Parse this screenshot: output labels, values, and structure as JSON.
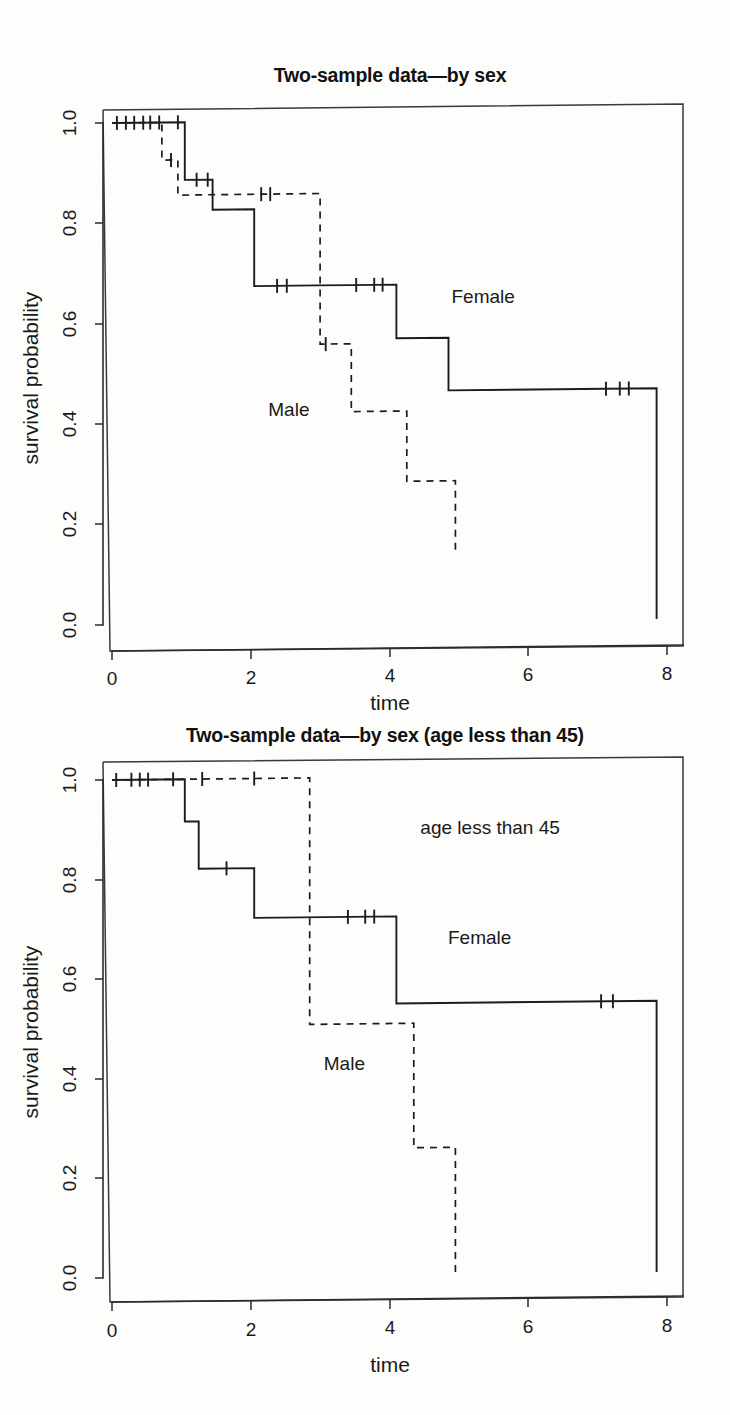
{
  "page": {
    "background": "#fdfdfc",
    "ink": "#1c1c1c"
  },
  "figures": [
    {
      "id": "figure-1",
      "title": "Two-sample data—by sex",
      "xlabel": "time",
      "ylabel": "survival probability",
      "xticks": [
        "0",
        "2",
        "4",
        "6",
        "8"
      ],
      "yticks": [
        "0.0",
        "0.2",
        "0.4",
        "0.6",
        "0.8",
        "1.0"
      ],
      "annotations": [
        {
          "text": "Female",
          "x": 5.35,
          "y": 0.645
        },
        {
          "text": "Male",
          "x": 2.55,
          "y": 0.425
        }
      ]
    },
    {
      "id": "figure-2",
      "title": "Two-sample data—by sex (age less than 45)",
      "xlabel": "time",
      "ylabel": "survival probability",
      "xticks": [
        "0",
        "2",
        "4",
        "6",
        "8"
      ],
      "yticks": [
        "0.0",
        "0.2",
        "0.4",
        "0.6",
        "0.8",
        "1.0"
      ],
      "annotations": [
        {
          "text": "age less than 45",
          "x": 5.45,
          "y": 0.895
        },
        {
          "text": "Female",
          "x": 5.3,
          "y": 0.675
        },
        {
          "text": "Male",
          "x": 3.35,
          "y": 0.425
        }
      ]
    }
  ],
  "chart_data": [
    {
      "type": "line",
      "subtype": "kaplan-meier-step",
      "title": "Two-sample data—by sex",
      "xlabel": "time",
      "ylabel": "survival probability",
      "xlim": [
        0,
        8.25
      ],
      "ylim": [
        0.0,
        1.0
      ],
      "xticks": [
        0,
        2,
        4,
        6,
        8
      ],
      "yticks": [
        0.0,
        0.2,
        0.4,
        0.6,
        0.8,
        1.0
      ],
      "grid": false,
      "legend": "inline-annotations",
      "series": [
        {
          "name": "Female",
          "linestyle": "solid",
          "color": "#1c1c1c",
          "steps": [
            {
              "time": 0.0,
              "surv": 1.0
            },
            {
              "time": 1.05,
              "surv": 0.885
            },
            {
              "time": 1.45,
              "surv": 0.825
            },
            {
              "time": 2.05,
              "surv": 0.672
            },
            {
              "time": 2.95,
              "surv": 0.672
            },
            {
              "time": 3.45,
              "surv": 0.672
            },
            {
              "time": 4.1,
              "surv": 0.565
            },
            {
              "time": 4.85,
              "surv": 0.46
            },
            {
              "time": 7.85,
              "surv": 0.0
            }
          ],
          "censored_times": [
            0.07,
            0.2,
            0.32,
            0.45,
            0.55,
            0.68,
            0.95,
            1.22,
            1.38,
            2.38,
            2.52,
            3.52,
            3.78,
            3.9,
            7.12,
            7.32,
            7.45
          ]
        },
        {
          "name": "Male",
          "linestyle": "dashed",
          "color": "#1c1c1c",
          "steps": [
            {
              "time": 0.0,
              "surv": 1.0
            },
            {
              "time": 0.72,
              "surv": 0.925
            },
            {
              "time": 0.95,
              "surv": 0.855
            },
            {
              "time": 2.78,
              "surv": 0.855
            },
            {
              "time": 3.0,
              "surv": 0.555
            },
            {
              "time": 3.45,
              "surv": 0.42
            },
            {
              "time": 4.25,
              "surv": 0.28
            },
            {
              "time": 4.95,
              "surv": 0.135
            }
          ],
          "censored_times": [
            0.85,
            2.15,
            2.28,
            3.08
          ]
        }
      ]
    },
    {
      "type": "line",
      "subtype": "kaplan-meier-step",
      "title": "Two-sample data—by sex (age less than 45)",
      "xlabel": "time",
      "ylabel": "survival probability",
      "xlim": [
        0,
        8.25
      ],
      "ylim": [
        0.0,
        1.0
      ],
      "xticks": [
        0,
        2,
        4,
        6,
        8
      ],
      "yticks": [
        0.0,
        0.2,
        0.4,
        0.6,
        0.8,
        1.0
      ],
      "grid": false,
      "legend": "inline-annotations",
      "series": [
        {
          "name": "Female",
          "linestyle": "solid",
          "color": "#1c1c1c",
          "steps": [
            {
              "time": 0.0,
              "surv": 1.0
            },
            {
              "time": 1.05,
              "surv": 0.915
            },
            {
              "time": 1.25,
              "surv": 0.82
            },
            {
              "time": 2.05,
              "surv": 0.72
            },
            {
              "time": 4.1,
              "surv": 0.545
            },
            {
              "time": 7.85,
              "surv": 0.0
            }
          ],
          "censored_times": [
            0.06,
            0.28,
            0.4,
            0.52,
            0.88,
            1.65,
            3.4,
            3.65,
            3.78,
            7.05,
            7.22
          ]
        },
        {
          "name": "Male",
          "linestyle": "dashed",
          "color": "#1c1c1c",
          "steps": [
            {
              "time": 0.0,
              "surv": 1.0
            },
            {
              "time": 2.85,
              "surv": 0.505
            },
            {
              "time": 4.35,
              "surv": 0.255
            },
            {
              "time": 4.95,
              "surv": 0.0
            }
          ],
          "censored_times": [
            1.3,
            2.05
          ]
        }
      ]
    }
  ]
}
